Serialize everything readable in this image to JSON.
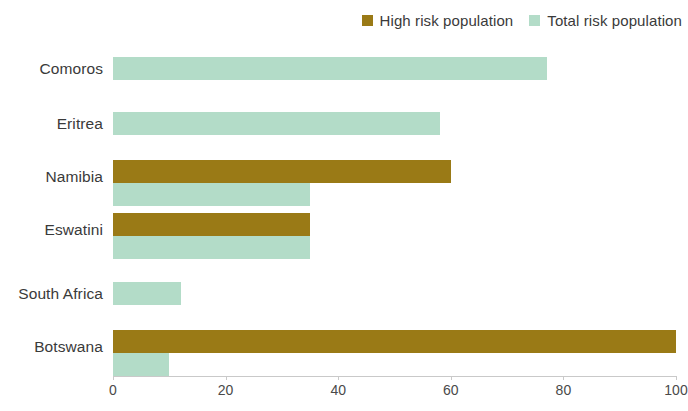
{
  "legend": {
    "position": "top-right",
    "entries": [
      {
        "label": "High risk population",
        "color": "#9a7a16",
        "icon": "square-swatch-icon"
      },
      {
        "label": "Total risk population",
        "color": "#b3dcc8",
        "icon": "square-swatch-icon"
      }
    ]
  },
  "axis": {
    "x_ticks": [
      "0",
      "20",
      "40",
      "60",
      "80",
      "100"
    ]
  },
  "categories": {
    "0": "Comoros",
    "1": "Eritrea",
    "2": "Namibia",
    "3": "Eswatini",
    "4": "South Africa",
    "5": "Botswana"
  },
  "chart_data": {
    "type": "bar",
    "orientation": "horizontal",
    "title": "",
    "subtitle": "",
    "xlabel": "",
    "ylabel": "",
    "xlim": [
      0,
      100
    ],
    "xticks": [
      0,
      20,
      40,
      60,
      80,
      100
    ],
    "grid": false,
    "legend_position": "top-right",
    "categories": [
      "Comoros",
      "Eritrea",
      "Namibia",
      "Eswatini",
      "South Africa",
      "Botswana"
    ],
    "series": [
      {
        "name": "High risk population",
        "color": "#9a7a16",
        "values": [
          0,
          0,
          60,
          35,
          0,
          100
        ]
      },
      {
        "name": "Total risk population",
        "color": "#b3dcc8",
        "values": [
          77,
          58,
          35,
          35,
          12,
          10
        ]
      }
    ]
  }
}
